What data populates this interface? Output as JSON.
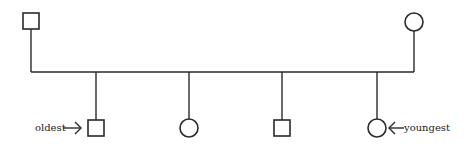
{
  "diagram": {
    "type": "pedigree",
    "parents": [
      {
        "id": "father",
        "sex": "male",
        "symbol": "square"
      },
      {
        "id": "mother",
        "sex": "female",
        "symbol": "circle"
      }
    ],
    "children": [
      {
        "id": "child-1",
        "sex": "male",
        "symbol": "square",
        "label": "oldest"
      },
      {
        "id": "child-2",
        "sex": "female",
        "symbol": "circle",
        "label": ""
      },
      {
        "id": "child-3",
        "sex": "male",
        "symbol": "square",
        "label": ""
      },
      {
        "id": "child-4",
        "sex": "female",
        "symbol": "circle",
        "label": "youngest"
      }
    ],
    "labels": {
      "oldest": "oldest",
      "youngest": "youngest"
    },
    "colors": {
      "line": "#2a2a2a",
      "background": "#ffffff"
    }
  }
}
